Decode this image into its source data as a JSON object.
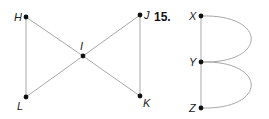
{
  "colors": {
    "edge": "#a8a8a8",
    "vertex": "#111111",
    "label": "#222222",
    "background": "#ffffff"
  },
  "graph_left": {
    "vertices": [
      {
        "id": "H",
        "label": "H",
        "x": 26,
        "y": 17
      },
      {
        "id": "J",
        "label": "J",
        "x": 140,
        "y": 15
      },
      {
        "id": "I",
        "label": "I",
        "x": 83,
        "y": 56
      },
      {
        "id": "L",
        "label": "L",
        "x": 26,
        "y": 97
      },
      {
        "id": "K",
        "label": "K",
        "x": 140,
        "y": 96
      }
    ],
    "edges": [
      [
        "H",
        "L"
      ],
      [
        "H",
        "I"
      ],
      [
        "I",
        "K"
      ],
      [
        "J",
        "I"
      ],
      [
        "I",
        "L"
      ],
      [
        "J",
        "K"
      ]
    ]
  },
  "exercise_number": "15.",
  "graph_right": {
    "vertices": [
      {
        "id": "X",
        "label": "X",
        "x": 201,
        "y": 16
      },
      {
        "id": "Y",
        "label": "Y",
        "x": 201,
        "y": 62
      },
      {
        "id": "Z",
        "label": "Z",
        "x": 201,
        "y": 108
      }
    ],
    "edges": [
      {
        "from": "X",
        "to": "Y",
        "type": "straight"
      },
      {
        "from": "Y",
        "to": "Z",
        "type": "straight"
      },
      {
        "from": "X",
        "to": "Y",
        "type": "curved"
      },
      {
        "from": "Y",
        "to": "Z",
        "type": "curved"
      }
    ]
  }
}
